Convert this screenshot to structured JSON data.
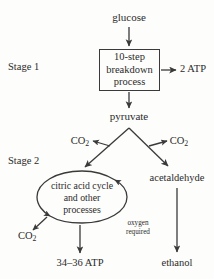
{
  "diagram": {
    "stage1_label": "Stage 1",
    "stage2_label": "Stage 2",
    "nodes": {
      "glucose": "glucose",
      "breakdown_box_line1": "10-step",
      "breakdown_box_line2": "breakdown",
      "breakdown_box_line3": "process",
      "atp_2": "2 ATP",
      "pyruvate": "pyruvate",
      "co2_left": "CO",
      "co2_left_sub": "2",
      "co2_right": "CO",
      "co2_right_sub": "2",
      "acetaldehyde": "acetaldehyde",
      "cycle_line1": "citric acid cycle",
      "cycle_line2": "and other",
      "cycle_line3": "processes",
      "oxygen_line1": "oxygen",
      "oxygen_line2": "required",
      "co2_bottom": "CO",
      "co2_bottom_sub": "2",
      "atp_34_36": "34–36 ATP",
      "ethanol": "ethanol"
    },
    "colors": {
      "background": "#fdfdfb",
      "ink": "#2b2b2b",
      "stroke": "#3a3a3a"
    }
  }
}
